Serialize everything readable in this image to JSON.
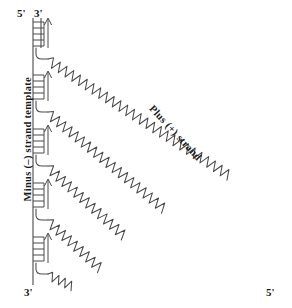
{
  "figure": {
    "background_color": "#ffffff",
    "stroke_color": "#3a3a3a",
    "labels": {
      "five_prime_top": "5'",
      "three_prime_top": "3'",
      "three_prime_bottom": "3'",
      "five_prime_bottom": "5'",
      "minus_strand": "Minus (–) strand template",
      "plus_strand": "Plus (+) strand"
    },
    "template_line": {
      "name": "minus-strand-template",
      "x": 33,
      "y_top": 18,
      "y_bottom": 285
    },
    "second_line": {
      "x": 41,
      "segments": [
        [
          18,
          48
        ]
      ]
    },
    "primers": [
      {
        "index": 1,
        "x_left": 33,
        "x_right": 44,
        "y_top": 20,
        "y_bottom": 46,
        "rungs": 5
      },
      {
        "index": 2,
        "x_left": 33,
        "x_right": 44,
        "y_top": 73,
        "y_bottom": 99,
        "rungs": 5
      },
      {
        "index": 3,
        "x_left": 33,
        "x_right": 44,
        "y_top": 127,
        "y_bottom": 153,
        "rungs": 5
      },
      {
        "index": 4,
        "x_left": 33,
        "x_right": 44,
        "y_top": 181,
        "y_bottom": 207,
        "rungs": 5
      },
      {
        "index": 5,
        "x_left": 33,
        "x_right": 44,
        "y_top": 235,
        "y_bottom": 261,
        "rungs": 5
      }
    ],
    "arrows": [
      {
        "index": 1,
        "x": 47,
        "y_tail": 46,
        "y_head": 20
      },
      {
        "index": 2,
        "x": 47,
        "y_tail": 99,
        "y_head": 73
      },
      {
        "index": 3,
        "x": 47,
        "y_tail": 153,
        "y_head": 127
      },
      {
        "index": 4,
        "x": 47,
        "y_tail": 207,
        "y_head": 181
      },
      {
        "index": 5,
        "x": 47,
        "y_tail": 261,
        "y_head": 235
      }
    ],
    "plus_strands": [
      {
        "index": 1,
        "start_x": 37,
        "start_y": 48,
        "end_x": 280,
        "end_y": 281,
        "hook": true
      },
      {
        "index": 2,
        "start_x": 37,
        "start_y": 101,
        "end_x": 228,
        "end_y": 281,
        "hook": true
      },
      {
        "index": 3,
        "start_x": 37,
        "start_y": 155,
        "end_x": 175,
        "end_y": 281,
        "hook": true
      },
      {
        "index": 4,
        "start_x": 37,
        "start_y": 209,
        "end_x": 122,
        "end_y": 281,
        "hook": true
      },
      {
        "index": 5,
        "start_x": 37,
        "start_y": 263,
        "end_x": 70,
        "end_y": 281,
        "hook": true
      }
    ]
  }
}
